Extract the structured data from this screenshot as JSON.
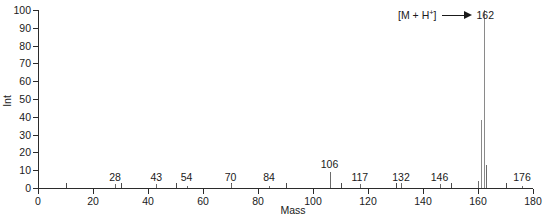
{
  "chart_data": {
    "type": "bar",
    "title": "",
    "xlabel": "Mass",
    "ylabel": "Int",
    "xlim": [
      0,
      180
    ],
    "ylim": [
      0,
      100
    ],
    "xticks": [
      0,
      20,
      40,
      60,
      80,
      100,
      120,
      140,
      160,
      180
    ],
    "yticks": [
      0,
      10,
      20,
      30,
      40,
      50,
      60,
      70,
      80,
      90,
      100
    ],
    "grid": false,
    "legend": null,
    "annotations": [
      {
        "formula_prefix": "[M + H",
        "formula_superscript": "+",
        "formula_suffix": "]",
        "arrow": "right-arrow",
        "target_label": "162"
      }
    ],
    "labeled_peaks": [
      {
        "mz": 28,
        "label": "28",
        "intensity": 2
      },
      {
        "mz": 43,
        "label": "43",
        "intensity": 2
      },
      {
        "mz": 54,
        "label": "54",
        "intensity": 1
      },
      {
        "mz": 70,
        "label": "70",
        "intensity": 2
      },
      {
        "mz": 84,
        "label": "84",
        "intensity": 1
      },
      {
        "mz": 106,
        "label": "106",
        "intensity": 9
      },
      {
        "mz": 117,
        "label": "117",
        "intensity": 2
      },
      {
        "mz": 132,
        "label": "132",
        "intensity": 2
      },
      {
        "mz": 146,
        "label": "146",
        "intensity": 2
      },
      {
        "mz": 162,
        "label": "162",
        "intensity": 100
      },
      {
        "mz": 176,
        "label": "176",
        "intensity": 1
      }
    ],
    "peaks": [
      {
        "mz": 28,
        "intensity": 2
      },
      {
        "mz": 43,
        "intensity": 2
      },
      {
        "mz": 54,
        "intensity": 1
      },
      {
        "mz": 70,
        "intensity": 2
      },
      {
        "mz": 84,
        "intensity": 1
      },
      {
        "mz": 106,
        "intensity": 9
      },
      {
        "mz": 117,
        "intensity": 2
      },
      {
        "mz": 132,
        "intensity": 3
      },
      {
        "mz": 146,
        "intensity": 2
      },
      {
        "mz": 160,
        "intensity": 4
      },
      {
        "mz": 161,
        "intensity": 38
      },
      {
        "mz": 162,
        "intensity": 100
      },
      {
        "mz": 163,
        "intensity": 13
      },
      {
        "mz": 176,
        "intensity": 1
      }
    ],
    "colors": {
      "axis": "#2b2b2b",
      "peak": "#6b6b6b",
      "peak_major": "#8a8a8a",
      "text": "#1a1a1a",
      "background": "#ffffff"
    }
  }
}
